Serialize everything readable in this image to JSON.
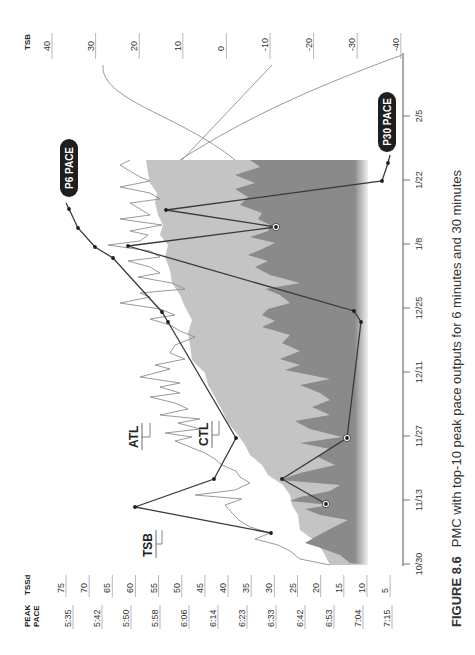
{
  "caption": {
    "figure": "FIGURE 8.6",
    "text": "PMC with top-10 peak pace outputs for 6 minutes and 30 minutes"
  },
  "axes": {
    "left_pace_header": [
      "PEAK",
      "PACE"
    ],
    "left_tssd_header": "TSSd",
    "right_header": "TSB",
    "pace_ticks": [
      "5:35",
      "5:42",
      "5:50",
      "5:58",
      "6:06",
      "6:14",
      "6:23",
      "6:33",
      "6:42",
      "6:53",
      "7:04",
      "7:15"
    ],
    "tssd_ticks": [
      75,
      70,
      65,
      60,
      55,
      50,
      45,
      40,
      35,
      30,
      25,
      20,
      15,
      10,
      5
    ],
    "tsb_ticks": [
      40,
      30,
      20,
      10,
      0,
      -10,
      -20,
      -30,
      -40
    ],
    "date_ticks": [
      "10/30",
      "11/13",
      "11/27",
      "12/11",
      "12/25",
      "1/8",
      "1/22",
      "2/5"
    ]
  },
  "labels": {
    "tsb": "TSB",
    "atl": "ATL",
    "ctl": "CTL",
    "p6": "P6 PACE",
    "p30": "P30 PACE"
  },
  "colors": {
    "ctl_fill": "#bdbdbd",
    "tsb_fill": "#7a7a7a",
    "atl_line": "#8a8a8a",
    "pace_line": "#3a3a3a",
    "pill": "#1e1e1e"
  },
  "chart_data": {
    "type": "line",
    "title": "PMC with top-10 peak pace outputs for 6 minutes and 30 minutes",
    "xlabel": "Date",
    "ylabel_left": "TSSd / Peak Pace",
    "ylabel_right": "TSB",
    "x_range": [
      "10/30",
      "2/5"
    ],
    "ylim_tssd": [
      5,
      75
    ],
    "ylim_tsb": [
      -40,
      40
    ],
    "series": [
      {
        "name": "P6 PACE",
        "x": [
          "11/2",
          "11/10",
          "11/16",
          "11/25",
          "12/24",
          "12/26",
          "1/5",
          "1/8",
          "1/12",
          "1/16"
        ],
        "pace": [
          "6:33",
          "5:50",
          "6:14",
          "6:23",
          "5:58",
          "6:06",
          "5:58",
          "6:06",
          "5:50",
          "5:35"
        ]
      },
      {
        "name": "P30 PACE",
        "x": [
          "11/9",
          "11/16",
          "11/10",
          "11/25",
          "12/24",
          "12/26",
          "1/8",
          "1/13",
          "1/16",
          "1/22",
          "1/26"
        ],
        "pace": [
          "6:42",
          "6:53",
          "6:42",
          "7:04",
          "7:04",
          "7:04",
          "6:14",
          "6:42",
          "6:06",
          "7:15",
          "7:15"
        ]
      },
      {
        "name": "ATL",
        "note": "spiky line, ~30–65 TSSd"
      },
      {
        "name": "CTL",
        "note": "light fill, rising ~35→50 TSSd"
      },
      {
        "name": "TSB",
        "note": "dark fill, oscillating ~-20 to +15"
      }
    ]
  }
}
